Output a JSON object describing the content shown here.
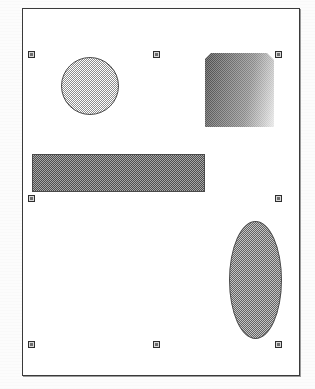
{
  "app": {
    "view_name": "drawing-canvas",
    "background_color": "#fcfcfc",
    "canvas_fill": "#ffffff",
    "canvas_border_color": "#3a3a3a"
  },
  "canvas": {
    "left": 22,
    "top": 8,
    "width": 278,
    "height": 368
  },
  "shapes": [
    {
      "name": "circle",
      "type": "ellipse",
      "fill": "dither-light",
      "fill_color": "#b5b5b5",
      "stroke_color": "#4a4a4a",
      "x": 38,
      "y": 48,
      "width": 58,
      "height": 58
    },
    {
      "name": "gradient-box",
      "type": "chamfered-rectangle",
      "fill": "linear-gradient",
      "gradient_from": "#4a4a4a",
      "gradient_to": "#e9e9e9",
      "stroke_color": "none",
      "x": 182,
      "y": 44,
      "width": 69,
      "height": 74
    },
    {
      "name": "horizontal-bar",
      "type": "rectangle",
      "fill": "dither-dark",
      "fill_color": "#8a8a8a",
      "stroke_color": "#4a4a4a",
      "x": 9,
      "y": 145,
      "width": 173,
      "height": 38
    },
    {
      "name": "vertical-ellipse",
      "type": "ellipse",
      "fill": "dither-medium",
      "fill_color": "#9d9d9d",
      "stroke_color": "#4a4a4a",
      "x": 206,
      "y": 212,
      "width": 53,
      "height": 118
    }
  ],
  "selection": {
    "handle_count": 8,
    "handle_size": 7,
    "handle_fill": "#6e6e6e",
    "handle_border": "#2e2e2e",
    "handles": [
      {
        "name": "handle-top-left",
        "col": "left",
        "row": "top"
      },
      {
        "name": "handle-top-center",
        "col": "mid",
        "row": "top"
      },
      {
        "name": "handle-top-right",
        "col": "right",
        "row": "top"
      },
      {
        "name": "handle-middle-left",
        "col": "left",
        "row": "mid"
      },
      {
        "name": "handle-middle-right",
        "col": "right",
        "row": "mid"
      },
      {
        "name": "handle-bottom-left",
        "col": "left",
        "row": "bottom"
      },
      {
        "name": "handle-bottom-center",
        "col": "mid",
        "row": "bottom"
      },
      {
        "name": "handle-bottom-right",
        "col": "right",
        "row": "bottom"
      }
    ]
  }
}
